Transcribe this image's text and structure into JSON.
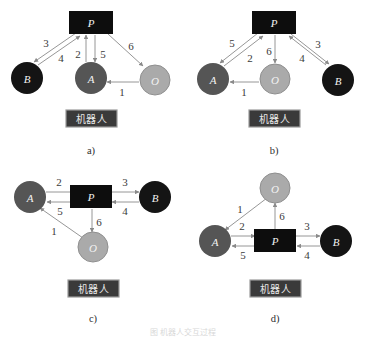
{
  "figure": {
    "caption": "图   机器人交互过程",
    "colors": {
      "node_p": "#0d0d0d",
      "node_a": "#555555",
      "node_b": "#141414",
      "node_o": "#aaaaaa",
      "edge": "#8a8a8a",
      "robot_box": "#3a3a3a",
      "robot_box_border": "#9a9a9a",
      "label_text": "#3b3b3b",
      "background": "#ffffff"
    },
    "robot_box_label": "机器人",
    "node_names": {
      "p": "P",
      "a": "A",
      "b": "B",
      "o": "O"
    },
    "panels": [
      {
        "id": "a",
        "caption": "a)",
        "nodes": [
          {
            "name": "P",
            "shape": "rect",
            "color": "#0d0d0d"
          },
          {
            "name": "B",
            "shape": "circle",
            "color": "#141414"
          },
          {
            "name": "A",
            "shape": "circle",
            "color": "#555555"
          },
          {
            "name": "O",
            "shape": "circle",
            "color": "#aaaaaa"
          }
        ],
        "edges": [
          {
            "label": "3",
            "from": "P",
            "to": "B"
          },
          {
            "label": "4",
            "from": "B",
            "to": "P"
          },
          {
            "label": "2",
            "from": "A",
            "to": "P"
          },
          {
            "label": "5",
            "from": "P",
            "to": "A"
          },
          {
            "label": "6",
            "from": "P",
            "to": "O"
          },
          {
            "label": "1",
            "from": "O",
            "to": "A"
          }
        ]
      },
      {
        "id": "b",
        "caption": "b)",
        "nodes": [
          {
            "name": "P",
            "shape": "rect",
            "color": "#0d0d0d"
          },
          {
            "name": "A",
            "shape": "circle",
            "color": "#555555"
          },
          {
            "name": "O",
            "shape": "circle",
            "color": "#aaaaaa"
          },
          {
            "name": "B",
            "shape": "circle",
            "color": "#141414"
          }
        ],
        "edges": [
          {
            "label": "5",
            "from": "P",
            "to": "A"
          },
          {
            "label": "2",
            "from": "A",
            "to": "P"
          },
          {
            "label": "6",
            "from": "P",
            "to": "O"
          },
          {
            "label": "3",
            "from": "B",
            "to": "P"
          },
          {
            "label": "4",
            "from": "P",
            "to": "B"
          },
          {
            "label": "1",
            "from": "O",
            "to": "A"
          }
        ]
      },
      {
        "id": "c",
        "caption": "c)",
        "nodes": [
          {
            "name": "A",
            "shape": "circle",
            "color": "#555555"
          },
          {
            "name": "P",
            "shape": "rect",
            "color": "#0d0d0d"
          },
          {
            "name": "B",
            "shape": "circle",
            "color": "#141414"
          },
          {
            "name": "O",
            "shape": "circle",
            "color": "#aaaaaa"
          }
        ],
        "edges": [
          {
            "label": "2",
            "from": "A",
            "to": "P"
          },
          {
            "label": "5",
            "from": "P",
            "to": "A"
          },
          {
            "label": "3",
            "from": "P",
            "to": "B"
          },
          {
            "label": "4",
            "from": "B",
            "to": "P"
          },
          {
            "label": "6",
            "from": "P",
            "to": "O"
          },
          {
            "label": "1",
            "from": "O",
            "to": "A"
          }
        ]
      },
      {
        "id": "d",
        "caption": "d)",
        "nodes": [
          {
            "name": "O",
            "shape": "circle",
            "color": "#aaaaaa"
          },
          {
            "name": "A",
            "shape": "circle",
            "color": "#555555"
          },
          {
            "name": "P",
            "shape": "rect",
            "color": "#0d0d0d"
          },
          {
            "name": "B",
            "shape": "circle",
            "color": "#141414"
          }
        ],
        "edges": [
          {
            "label": "1",
            "from": "O",
            "to": "A"
          },
          {
            "label": "6",
            "from": "P",
            "to": "O"
          },
          {
            "label": "2",
            "from": "A",
            "to": "P"
          },
          {
            "label": "5",
            "from": "P",
            "to": "A"
          },
          {
            "label": "3",
            "from": "P",
            "to": "B"
          },
          {
            "label": "4",
            "from": "B",
            "to": "P"
          }
        ]
      }
    ]
  }
}
